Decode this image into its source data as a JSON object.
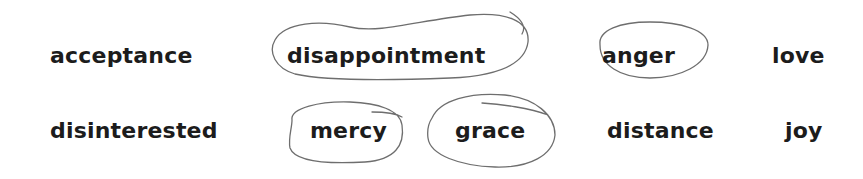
{
  "worksheet": {
    "words": [
      {
        "text": "acceptance",
        "row": 1,
        "circled": false
      },
      {
        "text": "disappointment",
        "row": 1,
        "circled": true
      },
      {
        "text": "anger",
        "row": 1,
        "circled": true
      },
      {
        "text": "love",
        "row": 1,
        "circled": false
      },
      {
        "text": "disinterested",
        "row": 2,
        "circled": false
      },
      {
        "text": "mercy",
        "row": 2,
        "circled": true
      },
      {
        "text": "grace",
        "row": 2,
        "circled": true
      },
      {
        "text": "distance",
        "row": 2,
        "circled": false
      },
      {
        "text": "joy",
        "row": 2,
        "circled": false
      }
    ],
    "ink_color": "#6e6e6e"
  }
}
